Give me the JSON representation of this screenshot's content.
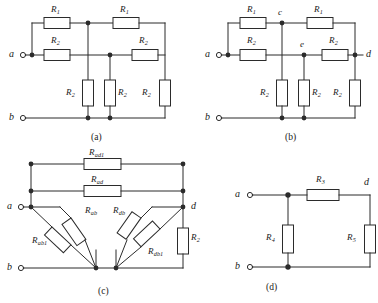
{
  "figure": {
    "type": "electrical-circuit-schematic",
    "panel_count": 4,
    "line_color": "#2b2b2b",
    "fill_color": "#ffffff",
    "background": "#ffffff"
  },
  "panels": {
    "a": {
      "caption": "(a)",
      "terminals": [
        {
          "name": "a",
          "label": "a"
        },
        {
          "name": "b",
          "label": "b"
        }
      ],
      "resistors": [
        {
          "id": "a-top-left",
          "label": "R",
          "sub": "1",
          "orient": "horizontal"
        },
        {
          "id": "a-top-right",
          "label": "R",
          "sub": "1",
          "orient": "horizontal"
        },
        {
          "id": "a-mid-left",
          "label": "R",
          "sub": "2",
          "orient": "horizontal"
        },
        {
          "id": "a-mid-right",
          "label": "R",
          "sub": "2",
          "orient": "horizontal"
        },
        {
          "id": "a-vert-1",
          "label": "R",
          "sub": "2",
          "orient": "vertical"
        },
        {
          "id": "a-vert-2",
          "label": "R",
          "sub": "2",
          "orient": "vertical"
        },
        {
          "id": "a-vert-3",
          "label": "R",
          "sub": "2",
          "orient": "vertical"
        }
      ]
    },
    "b": {
      "caption": "(b)",
      "terminals": [
        {
          "name": "a",
          "label": "a"
        },
        {
          "name": "b",
          "label": "b"
        },
        {
          "name": "d",
          "label": "d"
        }
      ],
      "nodes": [
        {
          "name": "c",
          "label": "c"
        },
        {
          "name": "e",
          "label": "e"
        }
      ],
      "resistors": [
        {
          "id": "b-top-left",
          "label": "R",
          "sub": "1",
          "orient": "horizontal"
        },
        {
          "id": "b-top-right",
          "label": "R",
          "sub": "1",
          "orient": "horizontal"
        },
        {
          "id": "b-mid-left",
          "label": "R",
          "sub": "2",
          "orient": "horizontal"
        },
        {
          "id": "b-mid-right",
          "label": "R",
          "sub": "2",
          "orient": "horizontal"
        },
        {
          "id": "b-vert-1",
          "label": "R",
          "sub": "2",
          "orient": "vertical"
        },
        {
          "id": "b-vert-2",
          "label": "R",
          "sub": "2",
          "orient": "vertical"
        },
        {
          "id": "b-vert-3",
          "label": "R",
          "sub": "2",
          "orient": "vertical"
        }
      ]
    },
    "c": {
      "caption": "(c)",
      "terminals": [
        {
          "name": "a",
          "label": "a"
        },
        {
          "name": "b",
          "label": "b"
        },
        {
          "name": "d",
          "label": "d"
        }
      ],
      "resistors": [
        {
          "id": "c-bus-top",
          "label": "R",
          "sub": "ad1",
          "orient": "horizontal"
        },
        {
          "id": "c-bus-second",
          "label": "R",
          "sub": "ad",
          "orient": "horizontal"
        },
        {
          "id": "c-diag-ab",
          "label": "R",
          "sub": "ab",
          "orient": "diagonal"
        },
        {
          "id": "c-diag-ab1",
          "label": "R",
          "sub": "ab1",
          "orient": "diagonal"
        },
        {
          "id": "c-diag-db",
          "label": "R",
          "sub": "db",
          "orient": "diagonal"
        },
        {
          "id": "c-diag-db1",
          "label": "R",
          "sub": "db1",
          "orient": "diagonal"
        },
        {
          "id": "c-vert-right",
          "label": "R",
          "sub": "2",
          "orient": "vertical"
        }
      ]
    },
    "d": {
      "caption": "(d)",
      "terminals": [
        {
          "name": "a",
          "label": "a"
        },
        {
          "name": "b",
          "label": "b"
        },
        {
          "name": "d",
          "label": "d"
        }
      ],
      "resistors": [
        {
          "id": "d-top",
          "label": "R",
          "sub": "3",
          "orient": "horizontal"
        },
        {
          "id": "d-vert-left",
          "label": "R",
          "sub": "4",
          "orient": "vertical"
        },
        {
          "id": "d-vert-right",
          "label": "R",
          "sub": "5",
          "orient": "vertical"
        }
      ]
    }
  }
}
